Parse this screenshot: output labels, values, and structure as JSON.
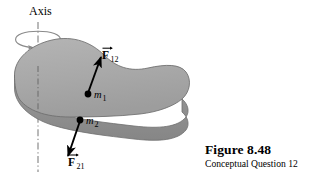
{
  "figure": {
    "axis_label": "Axis",
    "mass1_label": "m",
    "mass1_sub": "1",
    "mass2_label": "m",
    "mass2_sub": "2",
    "force12_label": "F",
    "force12_sub": "12",
    "force21_label": "F",
    "force21_sub": "21",
    "caption_title": "Figure 8.48",
    "caption_subtitle": "Conceptual Question 12"
  },
  "colors": {
    "background": "#ffffff",
    "body_top_fill": "#a9a9a9",
    "body_side_fill": "#8e8e8e",
    "body_outline": "#6e6e6e",
    "ink": "#000000",
    "axis_line": "#808080",
    "rotation_arc": "#8a8a8a"
  }
}
